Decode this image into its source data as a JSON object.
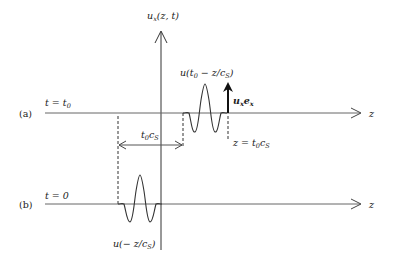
{
  "figure": {
    "vertical_axis_label": {
      "main": "u",
      "sub": "x",
      "args": "(z, t)"
    },
    "panel_a": {
      "tag": "(a)",
      "time_label": {
        "lhs": "t = t",
        "sub": "0"
      },
      "axis_label": "z",
      "wave_label": {
        "pre": "u(t",
        "sub0": "0",
        "mid": " − z/c",
        "subS": "S",
        "post": ")"
      },
      "vector_label": {
        "u": "u",
        "usub": "x",
        "e": "e",
        "esub": "x"
      },
      "position_label": {
        "pre": "z = t",
        "sub0": "0",
        "mid": "c",
        "subS": "S"
      },
      "distance_label": {
        "t": "t",
        "sub0": "0",
        "c": "c",
        "subS": "S"
      }
    },
    "panel_b": {
      "tag": "(b)",
      "time_label": "t = 0",
      "axis_label": "z",
      "wave_label": {
        "pre": "u(− z/c",
        "subS": "S",
        "post": ")"
      }
    },
    "colors": {
      "line": "#555555",
      "dark": "#111111",
      "text": "#222222"
    }
  }
}
